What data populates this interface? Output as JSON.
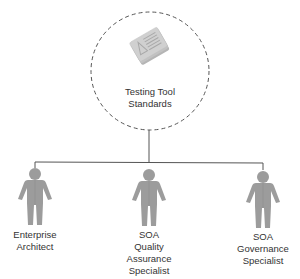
{
  "diagram": {
    "type": "hierarchy",
    "center_node": {
      "id": "testing-tool-standards",
      "icon": "document-stack-icon",
      "label_lines": [
        "Testing Tool",
        "Standards"
      ],
      "border_style": "dashed-circle"
    },
    "children": [
      {
        "id": "enterprise-architect",
        "icon": "person-icon",
        "label_lines": [
          "Enterprise",
          "Architect"
        ]
      },
      {
        "id": "soa-quality-assurance-specialist",
        "icon": "person-icon",
        "label_lines": [
          "SOA",
          "Quality",
          "Assurance",
          "Specialist"
        ]
      },
      {
        "id": "soa-governance-specialist",
        "icon": "person-icon",
        "label_lines": [
          "SOA",
          "Governance",
          "Specialist"
        ]
      }
    ],
    "edges": [
      {
        "from": "testing-tool-standards",
        "to": "enterprise-architect"
      },
      {
        "from": "testing-tool-standards",
        "to": "soa-quality-assurance-specialist"
      },
      {
        "from": "testing-tool-standards",
        "to": "soa-governance-specialist"
      }
    ],
    "colors": {
      "line": "#555555",
      "dashed_circle": "#555555",
      "figure": "#9c9c9c",
      "figure_shade": "#8a8a8a",
      "document": "#c8c8c8",
      "text": "#333333"
    }
  }
}
